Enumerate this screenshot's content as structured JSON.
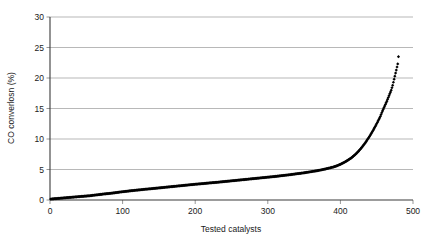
{
  "chart_data": {
    "type": "scatter",
    "title": "",
    "xlabel": "Tested catalysts",
    "ylabel": "CO converlosn (%)",
    "xlim": [
      0,
      500
    ],
    "ylim": [
      0,
      30
    ],
    "xticks": [
      0,
      100,
      200,
      300,
      400,
      500
    ],
    "yticks": [
      0,
      5,
      10,
      15,
      20,
      25,
      30
    ],
    "xtick_labels": [
      "0",
      "100",
      "200",
      "300",
      "400",
      "500"
    ],
    "ytick_labels": [
      "0",
      "5",
      "10",
      "15",
      "20",
      "25",
      "30"
    ],
    "grid": "horizontal",
    "legend": "none",
    "marker": "diamond",
    "marker_color": "#000000",
    "series_name": "CO conversion",
    "x": [
      1,
      5,
      10,
      15,
      20,
      25,
      30,
      35,
      40,
      45,
      50,
      55,
      60,
      65,
      70,
      75,
      80,
      85,
      90,
      95,
      100,
      105,
      110,
      115,
      120,
      125,
      130,
      135,
      140,
      145,
      150,
      155,
      160,
      165,
      170,
      175,
      180,
      185,
      190,
      195,
      200,
      205,
      210,
      215,
      220,
      225,
      230,
      235,
      240,
      245,
      250,
      255,
      260,
      265,
      270,
      275,
      280,
      285,
      290,
      295,
      300,
      305,
      310,
      315,
      320,
      325,
      330,
      335,
      340,
      345,
      350,
      355,
      360,
      365,
      370,
      375,
      380,
      385,
      390,
      395,
      400,
      405,
      410,
      415,
      420,
      425,
      430,
      435,
      440,
      445,
      450,
      455,
      458,
      461,
      464,
      466,
      468,
      470,
      471,
      472,
      473,
      474,
      475,
      476,
      477,
      478,
      479,
      480
    ],
    "y": [
      0.15,
      0.2,
      0.25,
      0.3,
      0.35,
      0.4,
      0.45,
      0.5,
      0.55,
      0.6,
      0.65,
      0.7,
      0.78,
      0.85,
      0.92,
      1.0,
      1.05,
      1.12,
      1.2,
      1.28,
      1.35,
      1.42,
      1.5,
      1.56,
      1.62,
      1.68,
      1.75,
      1.8,
      1.86,
      1.92,
      1.98,
      2.04,
      2.1,
      2.16,
      2.22,
      2.28,
      2.34,
      2.4,
      2.46,
      2.52,
      2.58,
      2.63,
      2.68,
      2.74,
      2.8,
      2.85,
      2.9,
      2.96,
      3.02,
      3.08,
      3.14,
      3.2,
      3.26,
      3.32,
      3.38,
      3.44,
      3.5,
      3.56,
      3.62,
      3.68,
      3.74,
      3.8,
      3.86,
      3.93,
      4.0,
      4.07,
      4.14,
      4.22,
      4.3,
      4.38,
      4.46,
      4.55,
      4.65,
      4.75,
      4.85,
      4.97,
      5.1,
      5.25,
      5.4,
      5.6,
      5.85,
      6.15,
      6.5,
      6.9,
      7.4,
      8.0,
      8.7,
      9.5,
      10.4,
      11.4,
      12.5,
      13.7,
      14.6,
      15.4,
      16.2,
      16.8,
      17.4,
      18.0,
      18.4,
      18.8,
      19.3,
      19.8,
      20.3,
      20.8,
      21.3,
      21.8,
      22.3,
      23.5
    ]
  },
  "axes": {
    "ylabel_text": "CO converlosn (%)",
    "xlabel_text": "Tested catalysts"
  }
}
